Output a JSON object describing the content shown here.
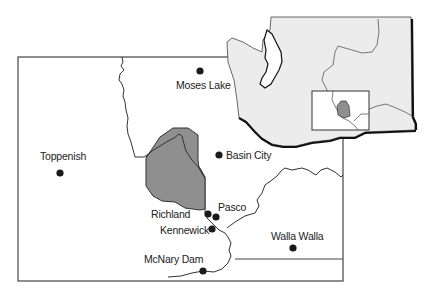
{
  "map": {
    "colors": {
      "background": "#ffffff",
      "border": "#444444",
      "river": "#333333",
      "shaded_area": "#8f8f8f",
      "state_fill": "#ececec",
      "city_dot": "#1a1a1a",
      "label": "#222222"
    },
    "cities": [
      {
        "name": "Moses Lake",
        "x": 200,
        "y": 71,
        "label_x": 176,
        "label_y": 88
      },
      {
        "name": "Basin City",
        "x": 219,
        "y": 155,
        "label_x": 226,
        "label_y": 159
      },
      {
        "name": "Toppenish",
        "x": 60,
        "y": 173,
        "label_x": 40,
        "label_y": 160
      },
      {
        "name": "Richland",
        "x": 208,
        "y": 214,
        "label_x": 151,
        "label_y": 218
      },
      {
        "name": "Pasco",
        "x": 215,
        "y": 217,
        "label_x": 218,
        "label_y": 211
      },
      {
        "name": "Kennewick",
        "x": 212,
        "y": 229,
        "label_x": 160,
        "label_y": 236
      },
      {
        "name": "Walla Walla",
        "x": 293,
        "y": 248,
        "label_x": 270,
        "label_y": 239
      },
      {
        "name": "McNary Dam",
        "x": 203,
        "y": 271,
        "label_x": 145,
        "label_y": 263
      }
    ],
    "inset": {
      "name": "Washington State locator",
      "highlight_box": "study area"
    }
  }
}
